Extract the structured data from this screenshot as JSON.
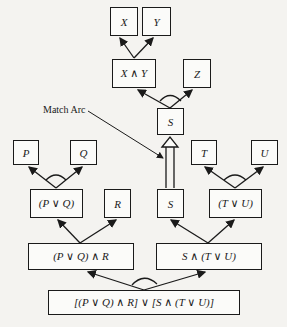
{
  "diagram": {
    "nodes": {
      "x": "X",
      "y": "Y",
      "x_and_y": "X ∧ Y",
      "z": "Z",
      "s_top": "S",
      "p": "P",
      "q": "Q",
      "p_or_q": "(P ∨ Q)",
      "r": "R",
      "s_mid": "S",
      "t": "T",
      "u": "U",
      "t_or_u": "(T ∨ U)",
      "pq_and_r": "(P ∨ Q) ∧ R",
      "s_and_tu": "S ∧ (T ∨ U)",
      "root": "[(P ∨ Q) ∧ R] ∨ [S ∧ (T ∨ U)]"
    },
    "annotations": {
      "match_arc": "Match Arc"
    },
    "edges": [
      {
        "from": "x_and_y",
        "to": "x"
      },
      {
        "from": "x_and_y",
        "to": "y"
      },
      {
        "from": "s_top",
        "to": "x_and_y"
      },
      {
        "from": "s_top",
        "to": "z"
      },
      {
        "from": "p_or_q",
        "to": "p"
      },
      {
        "from": "p_or_q",
        "to": "q"
      },
      {
        "from": "pq_and_r",
        "to": "p_or_q"
      },
      {
        "from": "pq_and_r",
        "to": "r"
      },
      {
        "from": "t_or_u",
        "to": "t"
      },
      {
        "from": "t_or_u",
        "to": "u"
      },
      {
        "from": "s_and_tu",
        "to": "s_mid"
      },
      {
        "from": "s_and_tu",
        "to": "t_or_u"
      },
      {
        "from": "root",
        "to": "pq_and_r"
      },
      {
        "from": "root",
        "to": "s_and_tu"
      },
      {
        "from": "s_mid",
        "to": "s_top",
        "type": "match-arc"
      }
    ]
  }
}
